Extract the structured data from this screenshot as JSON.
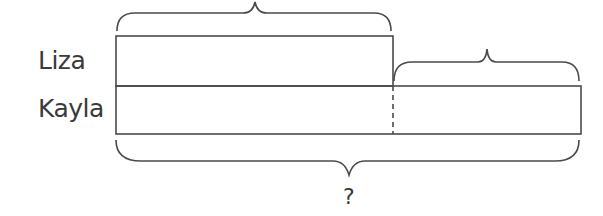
{
  "diagram": {
    "type": "tape-diagram",
    "rows": [
      {
        "label": "Liza",
        "relative_length": 1
      },
      {
        "label": "Kayla",
        "relative_length": 1.67
      }
    ],
    "top_brace_label": "",
    "extra_brace_label": "",
    "total_label": "?",
    "stroke_color": "#4a4a4a"
  }
}
